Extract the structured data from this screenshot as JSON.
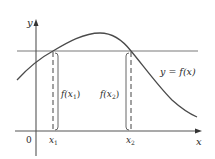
{
  "diagram": {
    "axes": {
      "x_label": "x",
      "y_label": "y",
      "origin_label": "0"
    },
    "curve_label": "y = f(x)",
    "points": [
      {
        "x_label": "x",
        "x_sub": "1",
        "value_label": "f(x",
        "value_sub": "1",
        "value_close": ")"
      },
      {
        "x_label": "x",
        "x_sub": "2",
        "value_label": "f(x",
        "value_sub": "2",
        "value_close": ")"
      }
    ],
    "colors": {
      "curve": "#555555",
      "axes": "#555555",
      "horizontal_line": "#777777",
      "text": "#2a2a2a"
    }
  }
}
